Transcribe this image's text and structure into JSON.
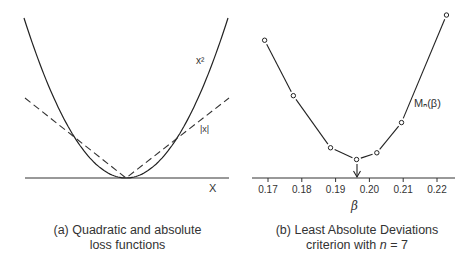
{
  "panels": {
    "a": {
      "caption_line1": "(a) Quadratic and absolute",
      "caption_line2": "loss functions",
      "x_label": "X",
      "quadratic_label": "x²",
      "absolute_label": "|x|"
    },
    "b": {
      "caption_line1": "(b) Least Absolute Deviations",
      "caption_line2_prefix": "criterion with ",
      "caption_line2_var": "n",
      "caption_line2_suffix": " = 7",
      "x_label": "β",
      "series_label": "Mₙ(β)",
      "x_ticks": [
        "0.17",
        "0.18",
        "0.19",
        "0.20",
        "0.21",
        "0.22"
      ]
    }
  },
  "chart_data": [
    {
      "type": "line",
      "title": "(a) Quadratic and absolute loss functions",
      "xlabel": "X",
      "ylabel": "",
      "series": [
        {
          "name": "x²",
          "style": "solid",
          "function": "x^2"
        },
        {
          "name": "|x|",
          "style": "dashed",
          "function": "abs(x)"
        }
      ],
      "grid": false
    },
    {
      "type": "line",
      "title": "(b) Least Absolute Deviations criterion with n = 7",
      "xlabel": "β",
      "ylabel": "",
      "x": [
        0.169,
        0.1775,
        0.1885,
        0.1962,
        0.2022,
        0.2095,
        0.2228
      ],
      "series": [
        {
          "name": "Mₙ(β)",
          "values": [
            0.82,
            0.49,
            0.18,
            0.11,
            0.15,
            0.33,
            0.97
          ],
          "marker": "open-circle"
        }
      ],
      "annotations": [
        {
          "type": "arrow",
          "x": 0.1962,
          "text": "minimum"
        }
      ],
      "x_ticks": [
        0.17,
        0.18,
        0.19,
        0.2,
        0.21,
        0.22
      ],
      "xlim": [
        0.1655,
        0.2255
      ],
      "grid": false
    }
  ]
}
